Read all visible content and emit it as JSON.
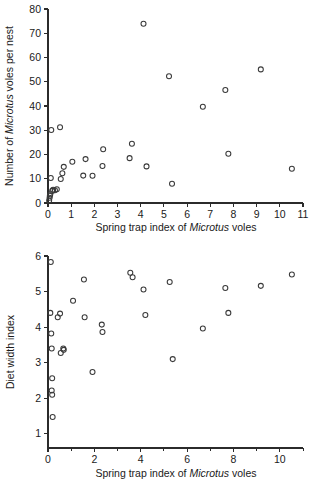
{
  "figure": {
    "background": "#ffffff",
    "point_color": "#3a3a3a",
    "axis_color": "#2b2b2b"
  },
  "chart_data": [
    {
      "type": "scatter",
      "panel": "top",
      "title": "",
      "xlabel_parts": [
        "Spring trap index of ",
        "Microtus",
        " voles"
      ],
      "xlabel": "Spring trap index of Microtus voles",
      "ylabel_parts": [
        "Number of ",
        "Microtus",
        " voles per nest"
      ],
      "ylabel": "Number of Microtus voles per nest",
      "xlim": [
        0,
        11
      ],
      "ylim": [
        0,
        80
      ],
      "xticks": [
        0,
        1,
        2,
        3,
        4,
        5,
        6,
        7,
        8,
        9,
        10,
        11
      ],
      "xticklabels": [
        "0",
        "1",
        "2",
        "3",
        "4",
        "5",
        "6",
        "7",
        "8",
        "9",
        "10",
        "11"
      ],
      "yticks": [
        0,
        10,
        20,
        30,
        40,
        50,
        60,
        70,
        80
      ],
      "yticklabels": [
        "0",
        "10",
        "20",
        "30",
        "40",
        "50",
        "60",
        "70",
        "80"
      ],
      "grid": false,
      "legend": false,
      "marker": "open-circle",
      "points": [
        [
          0.05,
          1.0
        ],
        [
          0.07,
          2.2
        ],
        [
          0.08,
          3.0
        ],
        [
          0.1,
          3.6
        ],
        [
          0.12,
          10.3
        ],
        [
          0.14,
          30.1
        ],
        [
          0.18,
          5.0
        ],
        [
          0.22,
          5.5
        ],
        [
          0.3,
          5.3
        ],
        [
          0.38,
          5.7
        ],
        [
          0.52,
          31.2
        ],
        [
          0.55,
          9.9
        ],
        [
          0.62,
          12.3
        ],
        [
          0.68,
          14.9
        ],
        [
          1.05,
          17.0
        ],
        [
          1.52,
          11.3
        ],
        [
          1.62,
          18.1
        ],
        [
          1.92,
          11.2
        ],
        [
          2.35,
          15.3
        ],
        [
          2.38,
          22.2
        ],
        [
          3.52,
          18.5
        ],
        [
          3.62,
          24.4
        ],
        [
          4.12,
          73.9
        ],
        [
          4.25,
          15.1
        ],
        [
          5.22,
          52.3
        ],
        [
          5.35,
          7.9
        ],
        [
          6.68,
          39.7
        ],
        [
          7.65,
          46.6
        ],
        [
          7.78,
          20.3
        ],
        [
          9.18,
          55.1
        ],
        [
          10.52,
          14.1
        ]
      ]
    },
    {
      "type": "scatter",
      "panel": "bottom",
      "title": "",
      "xlabel_parts": [
        "Spring trap index of ",
        "Microtus",
        " voles"
      ],
      "xlabel": "Spring trap index of Microtus voles",
      "ylabel": "Diet width index",
      "xlim": [
        0,
        11
      ],
      "ylim": [
        0.6,
        6
      ],
      "xticks": [
        0,
        1,
        2,
        3,
        4,
        5,
        6,
        7,
        8,
        9,
        10,
        11
      ],
      "xticklabels": [
        "0",
        "",
        "2",
        "",
        "4",
        "",
        "6",
        "",
        "8",
        "",
        "10",
        ""
      ],
      "yticks": [
        1,
        2,
        3,
        4,
        5,
        6
      ],
      "yticklabels": [
        "1",
        "2",
        "3",
        "4",
        "5",
        "6"
      ],
      "grid": false,
      "legend": false,
      "marker": "open-circle",
      "points": [
        [
          0.12,
          5.83
        ],
        [
          0.1,
          4.4
        ],
        [
          0.14,
          3.82
        ],
        [
          0.16,
          3.4
        ],
        [
          0.18,
          2.56
        ],
        [
          0.16,
          2.22
        ],
        [
          0.18,
          2.1
        ],
        [
          0.2,
          1.47
        ],
        [
          0.42,
          4.28
        ],
        [
          0.52,
          4.38
        ],
        [
          0.55,
          3.27
        ],
        [
          0.66,
          3.4
        ],
        [
          0.68,
          3.36
        ],
        [
          1.08,
          4.74
        ],
        [
          1.55,
          5.34
        ],
        [
          1.58,
          4.28
        ],
        [
          1.92,
          2.74
        ],
        [
          2.32,
          4.07
        ],
        [
          2.35,
          3.86
        ],
        [
          3.55,
          5.53
        ],
        [
          3.65,
          5.4
        ],
        [
          4.12,
          5.06
        ],
        [
          4.2,
          4.34
        ],
        [
          5.25,
          5.27
        ],
        [
          5.38,
          3.1
        ],
        [
          6.68,
          3.96
        ],
        [
          7.65,
          5.1
        ],
        [
          7.78,
          4.4
        ],
        [
          9.18,
          5.16
        ],
        [
          10.52,
          5.48
        ]
      ]
    }
  ]
}
